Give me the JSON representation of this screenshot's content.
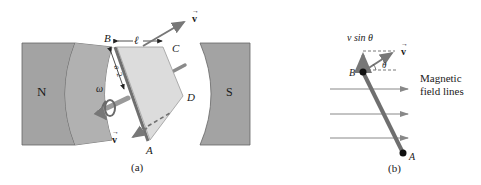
{
  "figure": {
    "panel_a": {
      "caption": "(a)",
      "pole_north_label": "N",
      "pole_south_label": "S",
      "corner_labels": {
        "A": "A",
        "B": "B",
        "C": "C",
        "D": "D"
      },
      "length_label": "ℓ",
      "half_width_label_num": "a",
      "half_width_label_den": "2",
      "angular_velocity_label": "ω",
      "velocity_top_label": "v",
      "velocity_bottom_label": "v"
    },
    "panel_b": {
      "caption": "(b)",
      "component_label": "v sin θ",
      "velocity_label": "v",
      "angle_label": "θ",
      "point_B_label": "B",
      "point_A_label": "A",
      "field_label_line1": "Magnetic",
      "field_label_line2": "field lines",
      "field_line_count": 3
    },
    "colors": {
      "pole_fill": "#a3a3a3",
      "pole_stroke": "#555555",
      "loop_fill": "#dcdcdc",
      "rod": "#6f6f6f",
      "arrow": "#777777",
      "text": "#1a1a1a",
      "dot": "#111111"
    }
  }
}
